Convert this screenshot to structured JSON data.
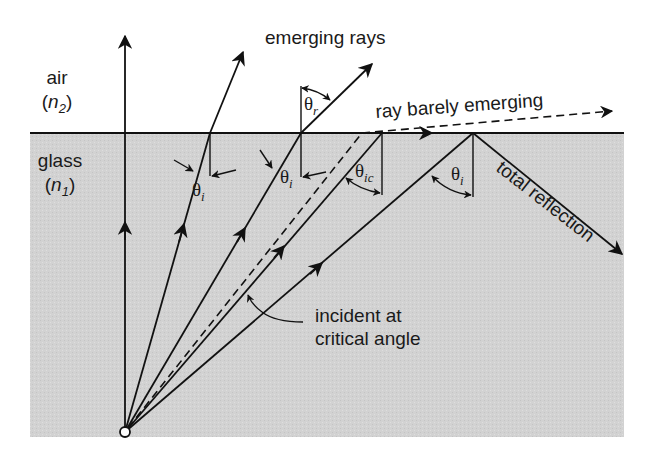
{
  "media": {
    "upper": {
      "name": "air",
      "index_symbol": "n",
      "index_sub": "2"
    },
    "lower": {
      "name": "glass",
      "index_symbol": "n",
      "index_sub": "1"
    }
  },
  "labels": {
    "emerging_rays": "emerging rays",
    "ray_barely_emerging": "ray barely emerging",
    "total_reflection": "total reflection",
    "incident_line1": "incident at",
    "incident_line2": "critical angle"
  },
  "angles": {
    "theta": "θ",
    "incidence_sub": "i",
    "refraction_sub": "r",
    "critical_sub": "ic"
  },
  "colors": {
    "glass": "#d4d4d4",
    "air": "#ffffff",
    "line": "#111111"
  }
}
